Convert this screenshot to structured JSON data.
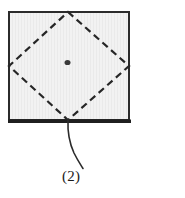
{
  "figure": {
    "type": "technical-line-drawing",
    "background_color": "#ffffff",
    "shapes": {
      "square": {
        "name": "outer-square",
        "x": 8,
        "y": 11,
        "width": 122,
        "height": 110,
        "fill_color": "#f1f1f1",
        "stroke_color": "#2b2b2b",
        "stroke_width": 2,
        "bottom_stroke_width": 3.5,
        "texture": "faint-vertical-hatching"
      },
      "diamond": {
        "name": "inscribed-dashed-diamond",
        "points": "68,12 129,66 68,120 9,66",
        "stroke_color": "#262626",
        "stroke_width": 2.2,
        "dash_length": 7,
        "dash_gap": 4.5,
        "fill": "none"
      },
      "center_dot": {
        "name": "center-point-marker",
        "cx": 67.5,
        "cy": 62.5,
        "rx": 3.0,
        "ry": 2.6,
        "fill_color": "#3a3a3a"
      },
      "leader_line": {
        "name": "callout-leader-line",
        "path": "M 68,120 C 67.5,133 69,142 74,153 C 78,161 81,165 83,168",
        "stroke_color": "#2b2b2b",
        "stroke_width": 1.6,
        "fill": "none"
      }
    }
  },
  "labels": {
    "callout": "(2)"
  }
}
